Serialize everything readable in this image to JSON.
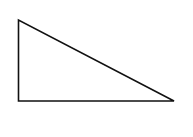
{
  "diagram": {
    "type": "right-triangle",
    "stroke_color": "#111111",
    "fill_color": "#ffffff",
    "vertices": {
      "top": [
        18.5,
        20
      ],
      "right_angle": [
        18.5,
        101
      ],
      "right": [
        174,
        101
      ]
    }
  }
}
